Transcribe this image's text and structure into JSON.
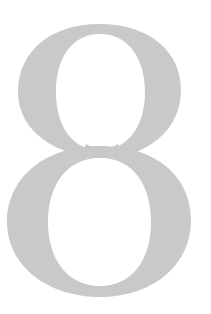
{
  "glyph": {
    "character": "8",
    "color": "#c9c9c9",
    "background": "#ffffff"
  }
}
